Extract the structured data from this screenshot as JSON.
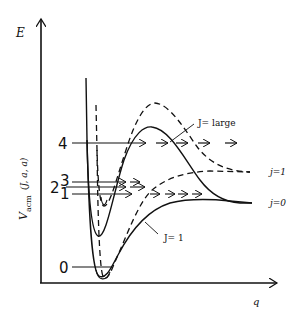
{
  "diagram": {
    "axes": {
      "y_label": "E",
      "x_label": "q",
      "y_side_label": "V",
      "y_side_subscript": "acm",
      "y_side_args": "(J, a, a)"
    },
    "levels": [
      {
        "label": "4",
        "y": 143
      },
      {
        "label": "3",
        "y": 182
      },
      {
        "label": "2",
        "y": 187
      },
      {
        "label": "1",
        "y": 194
      },
      {
        "label": "0",
        "y": 267
      }
    ],
    "curve_labels": {
      "j_large": "J= large",
      "j_one": "J= 1",
      "asym_j1": "j=1",
      "asym_j0": "j=0"
    },
    "legend": {
      "solid": "j = 0 channel",
      "dashed": "j = 1 channel"
    },
    "colors": {
      "ink": "#111111",
      "background": "#ffffff"
    }
  }
}
